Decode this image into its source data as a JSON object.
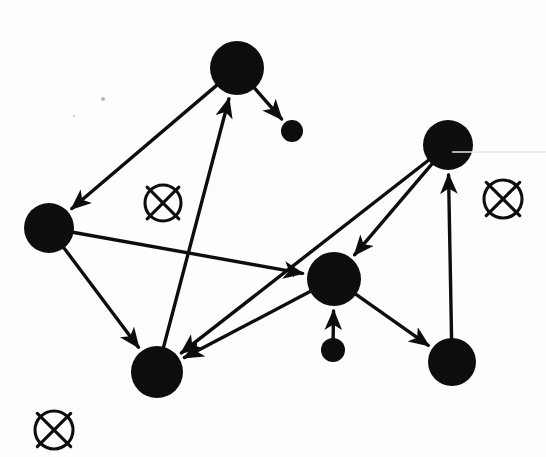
{
  "canvas": {
    "width": 546,
    "height": 457,
    "background_color": "#fdfdfd",
    "ink_color": "#111111",
    "description": "Scanned hand-drawn directed graph diagram with filled black disc nodes, arrow edges and three circled-X markers"
  },
  "nodes": [
    {
      "id": "n-top",
      "label": "",
      "cx": 237,
      "cy": 68,
      "r": 27,
      "size": "large"
    },
    {
      "id": "n-top-small",
      "label": "",
      "cx": 292,
      "cy": 131,
      "r": 11,
      "size": "small"
    },
    {
      "id": "n-left",
      "label": "",
      "cx": 49,
      "cy": 228,
      "r": 25,
      "size": "large"
    },
    {
      "id": "n-bottom-left",
      "label": "",
      "cx": 157,
      "cy": 372,
      "r": 26,
      "size": "large"
    },
    {
      "id": "n-center",
      "label": "",
      "cx": 334,
      "cy": 279,
      "r": 27,
      "size": "large"
    },
    {
      "id": "n-center-small",
      "label": "",
      "cx": 333,
      "cy": 350,
      "r": 12,
      "size": "small"
    },
    {
      "id": "n-top-right",
      "label": "",
      "cx": 448,
      "cy": 145,
      "r": 25,
      "size": "large"
    },
    {
      "id": "n-bottom-right",
      "label": "",
      "cx": 452,
      "cy": 362,
      "r": 24,
      "size": "large"
    }
  ],
  "edges": [
    {
      "id": "e1",
      "from": "n-top",
      "to": "n-left",
      "directed": true,
      "arrow_at": "to"
    },
    {
      "id": "e2",
      "from": "n-top",
      "to": "n-top-small",
      "directed": true,
      "arrow_at": "to"
    },
    {
      "id": "e3",
      "from": "n-bottom-left",
      "to": "n-top",
      "directed": true,
      "arrow_at": "to"
    },
    {
      "id": "e4",
      "from": "n-left",
      "to": "n-center",
      "directed": true,
      "arrow_at": "to"
    },
    {
      "id": "e5",
      "from": "n-left",
      "to": "n-bottom-left",
      "directed": true,
      "arrow_at": "to"
    },
    {
      "id": "e6",
      "from": "n-center",
      "to": "n-bottom-left",
      "directed": true,
      "arrow_at": "to"
    },
    {
      "id": "e7",
      "from": "n-top-right",
      "to": "n-center",
      "directed": true,
      "arrow_at": "to"
    },
    {
      "id": "e8",
      "from": "n-top-right",
      "to": "n-bottom-left",
      "directed": true,
      "arrow_at": "to"
    },
    {
      "id": "e9",
      "from": "n-center-small",
      "to": "n-center",
      "directed": true,
      "arrow_at": "to"
    },
    {
      "id": "e10",
      "from": "n-center",
      "to": "n-bottom-right",
      "directed": true,
      "arrow_at": "to"
    },
    {
      "id": "e11",
      "from": "n-bottom-right",
      "to": "n-top-right",
      "directed": true,
      "arrow_at": "to"
    }
  ],
  "markers": [
    {
      "id": "m-middle",
      "symbol": "circled-x",
      "cx": 163,
      "cy": 203,
      "r": 18
    },
    {
      "id": "m-right",
      "symbol": "circled-x",
      "cx": 503,
      "cy": 199,
      "r": 19
    },
    {
      "id": "m-bottom-left",
      "symbol": "circled-x",
      "cx": 54,
      "cy": 430,
      "r": 19
    }
  ],
  "artifacts": [
    {
      "id": "scanline",
      "type": "faint-horizontal-line",
      "x1": 452,
      "y1": 152,
      "x2": 546,
      "y2": 152
    },
    {
      "id": "speck-1",
      "type": "speck",
      "cx": 103,
      "cy": 99,
      "r": 2
    },
    {
      "id": "speck-2",
      "type": "speck",
      "cx": 74,
      "cy": 116,
      "r": 1
    }
  ]
}
